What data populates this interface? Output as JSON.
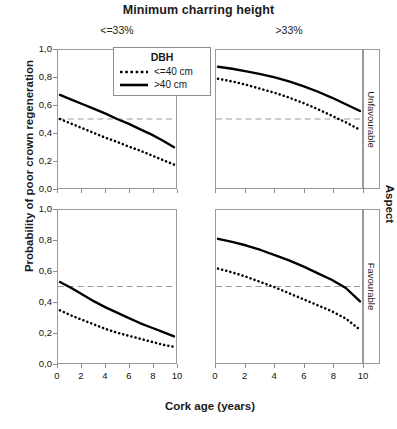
{
  "figure": {
    "title": "Minimum charring height",
    "xlabel": "Cork age (years)",
    "ylabel": "Probability of poor crown regeneration",
    "strip_title": "Aspect",
    "column_headers": [
      "<=33%",
      ">33%"
    ],
    "row_headers": [
      "Unfavourable",
      "Favourable"
    ]
  },
  "legend": {
    "title": "DBH",
    "entries": [
      {
        "label": "<=40 cm",
        "style": "dotted"
      },
      {
        "label": ">40 cm",
        "style": "solid"
      }
    ]
  },
  "axes": {
    "y_ticks": [
      "1,0",
      "0,8",
      "0,6",
      "0,4",
      "0,2",
      "0,0"
    ],
    "x_ticks": [
      "0",
      "2",
      "4",
      "6",
      "8",
      "10"
    ]
  },
  "chart_data": {
    "type": "line",
    "title": "Minimum charring height",
    "xlabel": "Cork age (years)",
    "ylabel": "Probability of poor crown regeneration",
    "xlim": [
      0,
      10
    ],
    "ylim": [
      0,
      1
    ],
    "grid": false,
    "legend_position": "inside-top-left-panel",
    "legend_title": "DBH",
    "reference_line": {
      "y": 0.5,
      "style": "dashed",
      "color": "#9a9a9a"
    },
    "facet_columns": {
      "name": "Minimum charring height",
      "levels": [
        "<=33%",
        ">33%"
      ]
    },
    "facet_rows": {
      "name": "Aspect",
      "levels": [
        "Unfavourable",
        "Favourable"
      ]
    },
    "x": [
      0,
      1,
      2,
      3,
      4,
      5,
      6,
      7,
      8,
      9,
      10
    ],
    "panels": [
      {
        "row": "Unfavourable",
        "column": "<=33%",
        "series": [
          {
            "name": ">40 cm",
            "style": "solid",
            "values": [
              0.68,
              0.645,
              0.61,
              0.575,
              0.54,
              0.5,
              0.465,
              0.425,
              0.385,
              0.34,
              0.29
            ]
          },
          {
            "name": "<=40 cm",
            "style": "dotted",
            "values": [
              0.5,
              0.465,
              0.43,
              0.395,
              0.36,
              0.33,
              0.295,
              0.265,
              0.23,
              0.195,
              0.16
            ]
          }
        ]
      },
      {
        "row": "Unfavourable",
        "column": ">33%",
        "series": [
          {
            "name": ">40 cm",
            "style": "solid",
            "values": [
              0.89,
              0.875,
              0.855,
              0.835,
              0.81,
              0.78,
              0.745,
              0.705,
              0.66,
              0.61,
              0.56
            ]
          },
          {
            "name": "<=40 cm",
            "style": "dotted",
            "values": [
              0.8,
              0.78,
              0.755,
              0.725,
              0.695,
              0.66,
              0.62,
              0.575,
              0.525,
              0.475,
              0.42
            ]
          }
        ]
      },
      {
        "row": "Favourable",
        "column": "<=33%",
        "series": [
          {
            "name": ">40 cm",
            "style": "solid",
            "values": [
              0.53,
              0.49,
              0.445,
              0.4,
              0.36,
              0.325,
              0.29,
              0.255,
              0.225,
              0.195,
              0.165
            ]
          },
          {
            "name": "<=40 cm",
            "style": "dotted",
            "values": [
              0.34,
              0.305,
              0.275,
              0.245,
              0.215,
              0.19,
              0.17,
              0.15,
              0.13,
              0.11,
              0.095
            ]
          }
        ]
      },
      {
        "row": "Favourable",
        "column": ">33%",
        "series": [
          {
            "name": ">40 cm",
            "style": "solid",
            "values": [
              0.82,
              0.8,
              0.775,
              0.745,
              0.71,
              0.675,
              0.635,
              0.59,
              0.545,
              0.49,
              0.4
            ]
          },
          {
            "name": "<=40 cm",
            "style": "dotted",
            "values": [
              0.62,
              0.595,
              0.565,
              0.53,
              0.495,
              0.455,
              0.415,
              0.375,
              0.335,
              0.285,
              0.21
            ]
          }
        ]
      }
    ]
  }
}
